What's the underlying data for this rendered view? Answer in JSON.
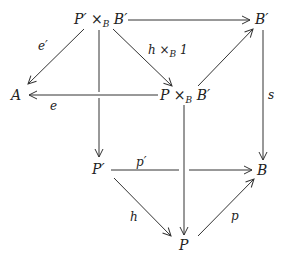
{
  "diagram": {
    "type": "commutative-diagram",
    "nodes": {
      "PpB": {
        "label": "P′ ×",
        "sub": "B",
        "tail": " B′"
      },
      "Bp": {
        "label": "B′"
      },
      "A": {
        "label": "A"
      },
      "PB": {
        "label": "P ×",
        "sub": "B",
        "tail": " B′"
      },
      "Pp": {
        "label": "P′"
      },
      "B": {
        "label": "B"
      },
      "P": {
        "label": "P"
      }
    },
    "edges": {
      "top": {
        "from": "P′ ×_B B′",
        "to": "B′",
        "label": ""
      },
      "eprime": {
        "from": "P′ ×_B B′",
        "to": "A",
        "label": "e′"
      },
      "hx1": {
        "from": "P′ ×_B B′",
        "to": "P ×_B B′",
        "label_main": "h ×",
        "label_sub": "B",
        "label_tail": " 1"
      },
      "left_vert": {
        "from": "P′ ×_B B′",
        "to": "P′",
        "label": ""
      },
      "e": {
        "from": "P ×_B B′",
        "to": "A",
        "label": "e"
      },
      "diag_up": {
        "from": "P ×_B B′",
        "to": "B′",
        "label": ""
      },
      "s": {
        "from": "B′",
        "to": "B",
        "label": "s"
      },
      "mid_vert": {
        "from": "P ×_B B′",
        "to": "P",
        "label": ""
      },
      "pprime": {
        "from": "P′",
        "to": "B",
        "label": "p′"
      },
      "h": {
        "from": "P′",
        "to": "P",
        "label": "h"
      },
      "p": {
        "from": "P",
        "to": "B",
        "label": "p"
      }
    },
    "colors": {
      "ink": "#333333",
      "background": "#ffffff"
    }
  }
}
